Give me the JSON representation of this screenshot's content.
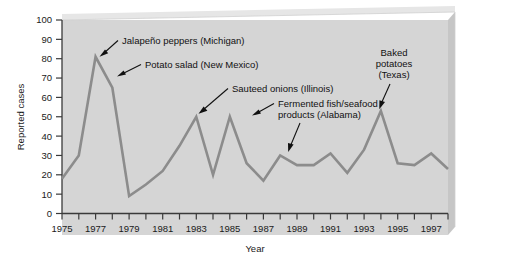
{
  "chart_data": {
    "type": "line",
    "title": "",
    "xlabel": "Year",
    "ylabel": "Reported cases",
    "xlim": [
      1975,
      1998
    ],
    "ylim": [
      0,
      100
    ],
    "grid": false,
    "legend": "none",
    "x": [
      1975,
      1976,
      1977,
      1978,
      1979,
      1980,
      1981,
      1982,
      1983,
      1984,
      1985,
      1986,
      1987,
      1988,
      1989,
      1990,
      1991,
      1992,
      1993,
      1994,
      1995,
      1996,
      1997,
      1998
    ],
    "values": [
      18,
      30,
      81,
      65,
      9,
      15,
      22,
      35,
      50,
      20,
      50,
      26,
      17,
      30,
      25,
      25,
      31,
      21,
      33,
      53,
      26,
      25,
      31,
      23
    ],
    "series": [
      {
        "name": "Reported cases",
        "values": [
          18,
          30,
          81,
          65,
          9,
          15,
          22,
          35,
          50,
          20,
          50,
          26,
          17,
          30,
          25,
          25,
          31,
          21,
          33,
          53,
          26,
          25,
          31,
          23
        ],
        "color": "#8c8c8c"
      }
    ],
    "y_ticks": [
      0,
      10,
      20,
      30,
      40,
      50,
      60,
      70,
      80,
      90,
      100
    ],
    "y_tick_labels": [
      "0",
      "10",
      "20",
      "30",
      "40",
      "50",
      "60",
      "70",
      "80",
      "90",
      "100"
    ],
    "x_ticks": [
      1975,
      1976,
      1977,
      1978,
      1979,
      1980,
      1981,
      1982,
      1983,
      1984,
      1985,
      1986,
      1987,
      1988,
      1989,
      1990,
      1991,
      1992,
      1993,
      1994,
      1995,
      1996,
      1997,
      1998
    ],
    "x_tick_labels": [
      "1975",
      "",
      "1977",
      "",
      "1979",
      "",
      "1981",
      "",
      "1983",
      "",
      "1985",
      "",
      "1987",
      "",
      "1989",
      "",
      "1991",
      "",
      "1993",
      "",
      "1995",
      "",
      "1997",
      ""
    ],
    "annotations": [
      {
        "id": "jalapeno",
        "lines": [
          "Jalapeño peppers (Michigan)"
        ],
        "points_to_year": 1977,
        "points_to_value": 81
      },
      {
        "id": "potato-salad",
        "lines": [
          "Potato salad (New Mexico)"
        ],
        "points_to_year": 1978,
        "points_to_value": 65
      },
      {
        "id": "sauteed-onions",
        "lines": [
          "Sauteed onions (Illinois)"
        ],
        "points_to_year": 1983,
        "points_to_value": 50
      },
      {
        "id": "fermented-fish",
        "lines": [
          "Fermented fish/seafood",
          "products (Alabama)"
        ],
        "points_to_year": 1988,
        "points_to_value": 30
      },
      {
        "id": "baked-potatoes",
        "lines": [
          "Baked",
          "potatoes",
          "(Texas)"
        ],
        "points_to_year": 1994,
        "points_to_value": 53
      }
    ],
    "colors": {
      "line": "#8c8c8c",
      "panel": "#d5d5d5",
      "panel_bevel": "#c2c2c2",
      "axis": "#3a3a3a",
      "text": "#111111",
      "background": "#ffffff"
    }
  }
}
